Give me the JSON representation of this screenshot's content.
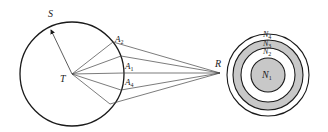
{
  "figure": {
    "colors": {
      "stroke": "#1a1a1a",
      "thin_stroke": "#444444",
      "ring_fill": "#c8c8c8",
      "background": "#ffffff"
    },
    "left_circle": {
      "label": "S",
      "center_label": "T",
      "center": [
        72,
        74
      ],
      "radius": 52
    },
    "boundary_points": [
      {
        "name": "A",
        "sub": "2",
        "point": [
          113,
          42
        ],
        "label_pos": [
          116,
          41
        ]
      },
      {
        "name": "",
        "sub": "",
        "point": [
          121,
          56
        ],
        "label_pos": null
      },
      {
        "name": "A",
        "sub": "1",
        "point": [
          124,
          73
        ],
        "label_pos": [
          126,
          66
        ]
      },
      {
        "name": "",
        "sub": "",
        "point": [
          121,
          90
        ],
        "label_pos": null
      },
      {
        "name": "A",
        "sub": "4",
        "point": [
          110,
          104
        ],
        "label_pos": [
          126,
          84
        ]
      }
    ],
    "point_R": {
      "label": "R",
      "point": [
        220,
        73
      ]
    },
    "right_rings": {
      "center": [
        268,
        75
      ],
      "circles": [
        {
          "name": "N",
          "sub": "4",
          "r": 41,
          "fill": "none"
        },
        {
          "name": "N",
          "sub": "3",
          "r": 35,
          "fill": "#c8c8c8"
        },
        {
          "name": "N",
          "sub": "2",
          "r": 27,
          "fill": "#ffffff"
        },
        {
          "name": "N",
          "sub": "1",
          "r": 17,
          "fill": "#c8c8c8"
        }
      ]
    },
    "labels": {
      "S": "S",
      "T": "T",
      "R": "R",
      "A2": "A",
      "A2_sub": "2",
      "A1": "A",
      "A1_sub": "1",
      "A4": "A",
      "A4_sub": "4",
      "N1": "N",
      "N1_sub": "1",
      "N2": "N",
      "N2_sub": "2",
      "N3": "N",
      "N3_sub": "3",
      "N4": "N",
      "N4_sub": "4"
    }
  }
}
